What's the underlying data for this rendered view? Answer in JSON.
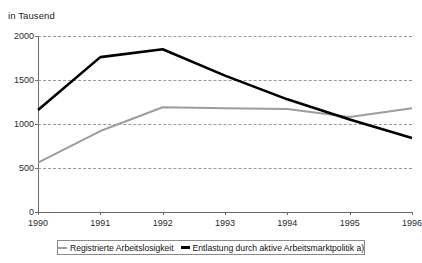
{
  "chart_data": {
    "type": "line",
    "title": "",
    "subtitle": "",
    "unit_label": "in Tausend",
    "xlabel": "",
    "ylabel": "",
    "categories": [
      "1990",
      "1991",
      "1992",
      "1993",
      "1994",
      "1995",
      "1996"
    ],
    "ylim": [
      0,
      2000
    ],
    "yticks": [
      0,
      500,
      1000,
      1500,
      2000
    ],
    "grid": true,
    "legend_position": "bottom",
    "series": [
      {
        "name": "Registrierte Arbeitslosigkeit",
        "color": "#9d9d9d",
        "values": [
          560,
          920,
          1190,
          1180,
          1170,
          1080,
          1180
        ]
      },
      {
        "name": "Entlastung durch aktive Arbeitsmarktpolitik a)",
        "color": "#000000",
        "values": [
          1160,
          1760,
          1850,
          1550,
          1280,
          1050,
          840
        ]
      }
    ]
  },
  "axis": {
    "y_tick_labels": [
      "2000",
      "1500",
      "1000",
      "500",
      "0"
    ],
    "x_tick_labels": [
      "1990",
      "1991",
      "1992",
      "1993",
      "1994",
      "1995",
      "1996"
    ]
  },
  "legend": {
    "items": [
      {
        "label": "Registrierte Arbeitslosigkeit",
        "color": "#9d9d9d"
      },
      {
        "label": "Entlastung durch aktive Arbeitsmarktpolitik a)",
        "color": "#000000"
      }
    ]
  },
  "colors": {
    "series_gray": "#9d9d9d",
    "series_black": "#000000",
    "grid": "#9a9a9a",
    "axis": "#6b6b6b",
    "background": "#ffffff"
  }
}
